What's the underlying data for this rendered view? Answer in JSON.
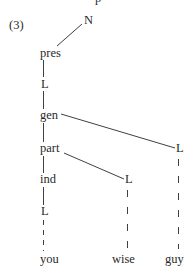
{
  "example": {
    "number": "(3)",
    "top_clipped_glyph": "p"
  },
  "nodes": [
    {
      "id": "N",
      "label": "N",
      "x": 84,
      "y": 13
    },
    {
      "id": "pres",
      "label": "pres",
      "x": 40,
      "y": 46
    },
    {
      "id": "L1",
      "label": "L",
      "x": 41,
      "y": 77
    },
    {
      "id": "gen",
      "label": "gen",
      "x": 40,
      "y": 108
    },
    {
      "id": "part",
      "label": "part",
      "x": 40,
      "y": 141
    },
    {
      "id": "L_right",
      "label": "L",
      "x": 176,
      "y": 141
    },
    {
      "id": "ind",
      "label": "ind",
      "x": 40,
      "y": 172
    },
    {
      "id": "L_mid",
      "label": "L",
      "x": 125,
      "y": 172
    },
    {
      "id": "L2",
      "label": "L",
      "x": 41,
      "y": 204
    },
    {
      "id": "you",
      "label": "you",
      "x": 40,
      "y": 252
    },
    {
      "id": "wise",
      "label": "wise",
      "x": 112,
      "y": 252
    },
    {
      "id": "guy",
      "label": "guy",
      "x": 165,
      "y": 252
    }
  ],
  "edges": [
    {
      "from": "N",
      "to": "pres",
      "style": "solid"
    },
    {
      "from": "pres",
      "to": "L1",
      "style": "solid"
    },
    {
      "from": "L1",
      "to": "gen",
      "style": "solid"
    },
    {
      "from": "gen",
      "to": "part",
      "style": "solid"
    },
    {
      "from": "gen",
      "to": "L_right",
      "style": "solid"
    },
    {
      "from": "part",
      "to": "ind",
      "style": "solid"
    },
    {
      "from": "part",
      "to": "L_mid",
      "style": "solid"
    },
    {
      "from": "ind",
      "to": "L2",
      "style": "solid"
    },
    {
      "from": "L2",
      "to": "you",
      "style": "dashed"
    },
    {
      "from": "L_mid",
      "to": "wise",
      "style": "dashed"
    },
    {
      "from": "L_right",
      "to": "guy",
      "style": "dashed"
    }
  ],
  "colors": {
    "ink": "#2a2a2a",
    "background": "#ffffff"
  }
}
